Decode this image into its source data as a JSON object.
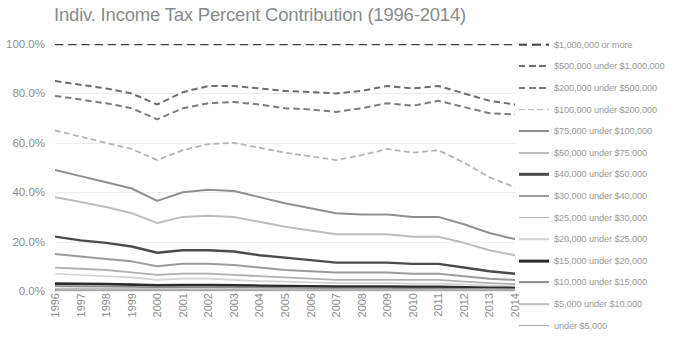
{
  "chart_data": {
    "type": "line",
    "title": "Indiv. Income Tax Percent Contribution (1996-2014)",
    "xlabel": "",
    "ylabel": "",
    "ylim": [
      0,
      100
    ],
    "ytick_labels": [
      "100.0%",
      "80.0%",
      "60.0%",
      "40.0%",
      "20.0%",
      "0.0%"
    ],
    "ytick_values": [
      100,
      80,
      60,
      40,
      20,
      0
    ],
    "grid": true,
    "legend_position": "right",
    "categories": [
      "1996",
      "1997",
      "1998",
      "1999",
      "2000",
      "2001",
      "2002",
      "2003",
      "2004",
      "2005",
      "2006",
      "2007",
      "2008",
      "2009",
      "2010",
      "2011",
      "2012",
      "2013",
      "2014"
    ],
    "series": [
      {
        "name": "$1,000,000 or more",
        "style": "dashed",
        "color": "#3f3f3f",
        "width": 2.6,
        "values": [
          100.0,
          100.0,
          100.0,
          100.0,
          100.0,
          100.0,
          100.0,
          100.0,
          100.0,
          100.0,
          100.0,
          100.0,
          100.0,
          100.0,
          100.0,
          100.0,
          100.0,
          100.0,
          100.0
        ]
      },
      {
        "name": "$500,000 under $1,000,000",
        "style": "dashed",
        "color": "#6e6e6e",
        "width": 2.0,
        "values": [
          85.0,
          83.5,
          82.0,
          80.0,
          75.5,
          80.5,
          83.0,
          83.0,
          82.0,
          81.0,
          80.5,
          80.0,
          81.0,
          83.0,
          82.0,
          83.0,
          80.0,
          77.0,
          75.5
        ]
      },
      {
        "name": "$200,000 under $500,000",
        "style": "dashed",
        "color": "#7d7d7d",
        "width": 2.0,
        "values": [
          79.0,
          77.5,
          76.0,
          74.0,
          69.5,
          74.0,
          76.0,
          76.5,
          75.5,
          74.0,
          73.5,
          72.5,
          74.0,
          76.0,
          75.0,
          77.0,
          74.5,
          72.0,
          71.5
        ]
      },
      {
        "name": "$100,000 under $200,000",
        "style": "dashed",
        "color": "#b4b4b4",
        "width": 1.8,
        "values": [
          65.0,
          62.5,
          60.0,
          57.5,
          53.0,
          57.0,
          59.5,
          60.0,
          58.0,
          56.0,
          54.5,
          53.0,
          55.0,
          57.5,
          56.0,
          57.0,
          52.0,
          46.0,
          42.0
        ]
      },
      {
        "name": "$75,000 under $100,000",
        "style": "solid",
        "color": "#8f8f8f",
        "width": 2.0,
        "values": [
          49.0,
          46.5,
          44.0,
          41.5,
          36.5,
          40.0,
          41.0,
          40.5,
          38.0,
          35.5,
          33.5,
          31.5,
          31.0,
          31.0,
          30.0,
          30.0,
          27.0,
          23.5,
          21.0
        ]
      },
      {
        "name": "$50,000 under $75,000",
        "style": "solid",
        "color": "#bdbdbd",
        "width": 2.0,
        "values": [
          38.0,
          36.0,
          34.0,
          31.5,
          27.5,
          30.0,
          30.5,
          30.0,
          28.0,
          26.0,
          24.5,
          23.0,
          23.0,
          23.0,
          22.0,
          22.0,
          19.5,
          16.5,
          14.5
        ]
      },
      {
        "name": "$40,000 under $50,000",
        "style": "solid",
        "color": "#4b4b4b",
        "width": 2.4,
        "values": [
          22.0,
          20.5,
          19.5,
          18.0,
          15.5,
          16.5,
          16.5,
          16.0,
          14.5,
          13.5,
          12.5,
          11.5,
          11.5,
          11.5,
          11.0,
          11.0,
          9.5,
          8.0,
          7.0
        ]
      },
      {
        "name": "$30,000 under $40,000",
        "style": "solid",
        "color": "#9c9c9c",
        "width": 2.0,
        "values": [
          15.0,
          14.0,
          13.0,
          12.0,
          10.0,
          11.0,
          11.0,
          10.5,
          9.5,
          8.5,
          8.0,
          7.5,
          7.5,
          7.5,
          7.0,
          7.0,
          6.0,
          5.0,
          4.5
        ]
      },
      {
        "name": "$25,000 under $30,000",
        "style": "solid",
        "color": "#b0b0b0",
        "width": 1.8,
        "values": [
          9.5,
          9.0,
          8.5,
          7.5,
          6.5,
          7.0,
          7.0,
          6.5,
          6.0,
          5.5,
          5.0,
          4.5,
          4.5,
          4.5,
          4.5,
          4.5,
          3.8,
          3.2,
          2.8
        ]
      },
      {
        "name": "$20,000 under $25,000",
        "style": "solid",
        "color": "#d2d2d2",
        "width": 1.6,
        "values": [
          7.0,
          6.5,
          6.0,
          5.5,
          4.5,
          5.0,
          5.0,
          4.5,
          4.0,
          3.8,
          3.5,
          3.2,
          3.2,
          3.2,
          3.0,
          3.0,
          2.6,
          2.2,
          2.0
        ]
      },
      {
        "name": "$15,000 under $20,000",
        "style": "solid",
        "color": "#2b2b2b",
        "width": 2.8,
        "values": [
          3.0,
          2.9,
          2.8,
          2.6,
          2.3,
          2.4,
          2.4,
          2.3,
          2.1,
          2.0,
          1.9,
          1.8,
          1.8,
          1.8,
          1.7,
          1.7,
          1.5,
          1.3,
          1.2
        ]
      },
      {
        "name": "$10,000 under $15,000",
        "style": "solid",
        "color": "#8c8c8c",
        "width": 1.8,
        "values": [
          2.0,
          1.9,
          1.8,
          1.7,
          1.5,
          1.6,
          1.6,
          1.5,
          1.4,
          1.3,
          1.2,
          1.1,
          1.1,
          1.1,
          1.0,
          1.0,
          0.9,
          0.8,
          0.7
        ]
      },
      {
        "name": "$5,000 under $10,000",
        "style": "solid",
        "color": "#c0c0c0",
        "width": 1.6,
        "values": [
          1.0,
          0.95,
          0.9,
          0.85,
          0.75,
          0.8,
          0.8,
          0.75,
          0.7,
          0.65,
          0.6,
          0.55,
          0.55,
          0.55,
          0.5,
          0.5,
          0.45,
          0.4,
          0.35
        ]
      },
      {
        "name": "under $5,000",
        "style": "solid",
        "color": "#a8a8a8",
        "width": 1.8,
        "values": [
          0.4,
          0.38,
          0.36,
          0.34,
          0.3,
          0.32,
          0.32,
          0.3,
          0.28,
          0.26,
          0.24,
          0.22,
          0.22,
          0.22,
          0.2,
          0.2,
          0.18,
          0.16,
          0.15
        ]
      }
    ]
  }
}
